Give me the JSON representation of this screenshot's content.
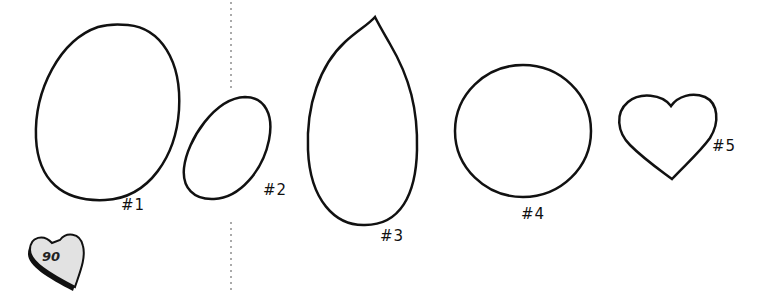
{
  "page_badge": {
    "number": "90",
    "shape": "heart-icon",
    "fill": "#e2e2e2"
  },
  "divider": {
    "style": "dotted",
    "color": "#aaaaaa"
  },
  "shapes": [
    {
      "id": "1",
      "label": "#1",
      "shape": "large-oval"
    },
    {
      "id": "2",
      "label": "#2",
      "shape": "small-tilted-oval"
    },
    {
      "id": "3",
      "label": "#3",
      "shape": "teardrop"
    },
    {
      "id": "4",
      "label": "#4",
      "shape": "circle"
    },
    {
      "id": "5",
      "label": "#5",
      "shape": "heart"
    }
  ]
}
